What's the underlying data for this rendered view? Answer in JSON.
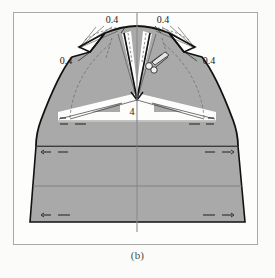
{
  "figure": {
    "caption": "(b)",
    "type": "garment-pattern-draft",
    "frame": {
      "x": 13,
      "y": 12,
      "width": 245,
      "height": 233
    },
    "colors": {
      "fabric_fill": "#a9a9a9",
      "fabric_fill_light": "#bdbdbd",
      "background": "#fdfdfc",
      "outline": "#111111",
      "construction_line": "#5d5d5d",
      "frame_border": "#a9a9a9",
      "caption_text": "#4a4a4a"
    },
    "labels": [
      {
        "id": "dart-top-left",
        "text": "0.4",
        "x": 112,
        "y": 22
      },
      {
        "id": "dart-top-right",
        "text": "0.4",
        "x": 156,
        "y": 22
      },
      {
        "id": "dart-side-left",
        "text": "0.4",
        "x": 62,
        "y": 62
      },
      {
        "id": "dart-side-right",
        "text": "0.4",
        "x": 200,
        "y": 62
      },
      {
        "id": "center-depth",
        "text": "4",
        "x": 131,
        "y": 111
      }
    ],
    "leader_lines": [
      {
        "id": "leader-top-left",
        "x1": 126,
        "y1": 26,
        "x2": 120,
        "y2": 33
      },
      {
        "id": "leader-top-right",
        "x1": 155,
        "y1": 26,
        "x2": 162,
        "y2": 33
      },
      {
        "id": "leader-side-left",
        "x1": 77,
        "y1": 61,
        "x2": 88,
        "y2": 55
      },
      {
        "id": "leader-side-right",
        "x1": 198,
        "y1": 61,
        "x2": 187,
        "y2": 55
      }
    ],
    "center_line": {
      "x": 137,
      "y_top": 13,
      "y_bottom": 232
    }
  }
}
